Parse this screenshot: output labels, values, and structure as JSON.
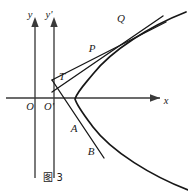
{
  "figure": {
    "caption": "图 3",
    "axes": {
      "x_axis_label": "x",
      "y_axis_label": "y",
      "y_prime_axis_label": "y'",
      "origin_label": "O",
      "origin_prime_label": "O'"
    },
    "points": [
      {
        "id": "Q",
        "label": "Q"
      },
      {
        "id": "P",
        "label": "P"
      },
      {
        "id": "T",
        "label": "T"
      },
      {
        "id": "A",
        "label": "A"
      },
      {
        "id": "B",
        "label": "B"
      }
    ],
    "colors": {
      "ink": "#171717",
      "axis": "#3a3a3a",
      "background": "#ffffff"
    }
  }
}
